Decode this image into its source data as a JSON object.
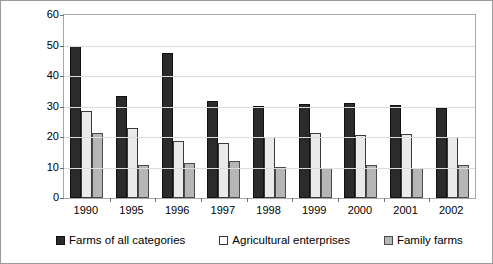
{
  "chart_data": {
    "type": "bar",
    "title": "",
    "xlabel": "",
    "ylabel": "Poultry population, millions",
    "ylim": [
      0,
      60
    ],
    "yticks": [
      0,
      10,
      20,
      30,
      40,
      50,
      60
    ],
    "grid": true,
    "legend_position": "bottom",
    "categories": [
      "1990",
      "1995",
      "1996",
      "1997",
      "1998",
      "1999",
      "2000",
      "2001",
      "2002"
    ],
    "series": [
      {
        "name": "Farms of all categories",
        "color": "#2b2b2b",
        "values": [
          49.8,
          33.4,
          47.5,
          31.8,
          30.2,
          30.7,
          31.0,
          30.6,
          29.6
        ]
      },
      {
        "name": "Agricultural enterprises",
        "color": "#eaeaea",
        "values": [
          28.6,
          23.0,
          18.6,
          17.9,
          20.1,
          21.4,
          20.8,
          21.0,
          20.0
        ]
      },
      {
        "name": "Family farms",
        "color": "#b6b6b6",
        "values": [
          21.3,
          10.7,
          11.5,
          12.0,
          10.2,
          9.8,
          10.7,
          10.0,
          10.7
        ]
      }
    ]
  },
  "axis": {
    "y_title": "Poultry population, millions",
    "y_tick_labels": [
      "60",
      "50",
      "40",
      "30",
      "20",
      "10",
      "0"
    ],
    "x_tick_labels": [
      "1990",
      "1995",
      "1996",
      "1997",
      "1998",
      "1999",
      "2000",
      "2001",
      "2002"
    ]
  },
  "legend": {
    "items": [
      {
        "label": "Farms of all categories",
        "swatch": "dark-square-icon"
      },
      {
        "label": "Agricultural enterprises",
        "swatch": "white-square-icon"
      },
      {
        "label": "Family farms",
        "swatch": "gray-square-icon"
      }
    ]
  }
}
